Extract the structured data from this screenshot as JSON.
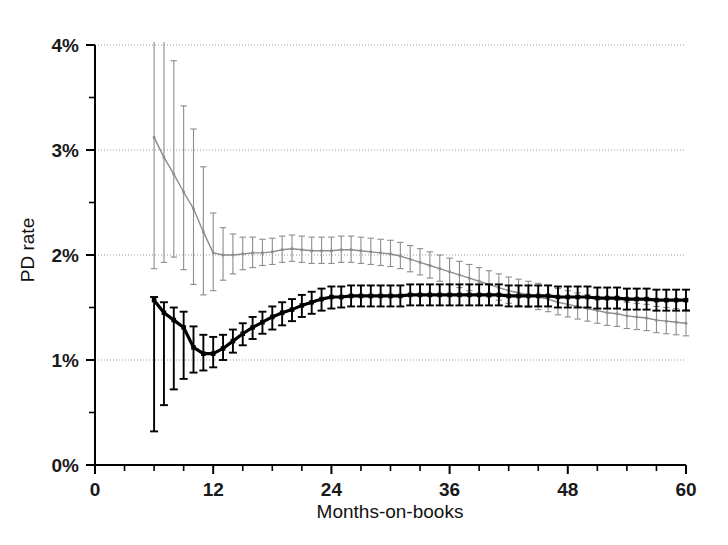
{
  "chart_data": {
    "type": "line",
    "title": "",
    "xlabel": "Months-on-books",
    "ylabel": "PD rate",
    "xlim": [
      0,
      60
    ],
    "ylim": [
      0,
      4
    ],
    "grid": "horizontal-dotted",
    "legend_position": "none",
    "x_ticks_major": [
      0,
      12,
      24,
      36,
      48,
      60
    ],
    "x_tick_labels": [
      "0",
      "12",
      "24",
      "36",
      "48",
      "60"
    ],
    "x_ticks_minor_step": 3,
    "y_ticks_major": [
      0,
      1,
      2,
      3,
      4
    ],
    "y_tick_labels": [
      "0%",
      "1%",
      "2%",
      "3%",
      "4%"
    ],
    "y_ticks_minor_step": 0.5,
    "error_bars": "vertical-whiskers-per-point",
    "series": [
      {
        "name": "series-black",
        "color": "#000000",
        "line_width": 3.2,
        "marker": "square",
        "x": [
          6,
          7,
          8,
          9,
          10,
          11,
          12,
          13,
          14,
          15,
          16,
          17,
          18,
          19,
          20,
          21,
          22,
          23,
          24,
          25,
          26,
          27,
          28,
          29,
          30,
          31,
          32,
          33,
          34,
          35,
          36,
          37,
          38,
          39,
          40,
          41,
          42,
          43,
          44,
          45,
          46,
          47,
          48,
          49,
          50,
          51,
          52,
          53,
          54,
          55,
          56,
          57,
          58,
          59,
          60
        ],
        "values": [
          1.57,
          1.45,
          1.38,
          1.31,
          1.12,
          1.06,
          1.06,
          1.11,
          1.18,
          1.25,
          1.31,
          1.36,
          1.41,
          1.45,
          1.48,
          1.52,
          1.55,
          1.58,
          1.6,
          1.6,
          1.61,
          1.61,
          1.61,
          1.61,
          1.61,
          1.61,
          1.62,
          1.62,
          1.62,
          1.62,
          1.62,
          1.62,
          1.62,
          1.62,
          1.62,
          1.62,
          1.61,
          1.61,
          1.61,
          1.61,
          1.61,
          1.6,
          1.6,
          1.6,
          1.6,
          1.59,
          1.59,
          1.59,
          1.58,
          1.58,
          1.58,
          1.57,
          1.57,
          1.57,
          1.57
        ],
        "err_low": [
          0.32,
          0.57,
          0.72,
          0.82,
          0.88,
          0.9,
          0.93,
          1.0,
          1.07,
          1.14,
          1.2,
          1.25,
          1.29,
          1.33,
          1.37,
          1.41,
          1.44,
          1.47,
          1.49,
          1.5,
          1.51,
          1.51,
          1.51,
          1.51,
          1.51,
          1.51,
          1.52,
          1.52,
          1.52,
          1.52,
          1.52,
          1.52,
          1.52,
          1.52,
          1.52,
          1.52,
          1.51,
          1.51,
          1.51,
          1.51,
          1.51,
          1.5,
          1.5,
          1.5,
          1.5,
          1.49,
          1.49,
          1.49,
          1.48,
          1.48,
          1.48,
          1.47,
          1.47,
          1.47,
          1.47
        ],
        "err_high": [
          1.6,
          1.55,
          1.5,
          1.46,
          1.32,
          1.24,
          1.22,
          1.24,
          1.29,
          1.35,
          1.41,
          1.46,
          1.51,
          1.55,
          1.58,
          1.62,
          1.65,
          1.68,
          1.7,
          1.7,
          1.71,
          1.71,
          1.71,
          1.71,
          1.71,
          1.71,
          1.72,
          1.72,
          1.72,
          1.72,
          1.72,
          1.72,
          1.72,
          1.72,
          1.72,
          1.72,
          1.71,
          1.71,
          1.71,
          1.71,
          1.71,
          1.7,
          1.7,
          1.7,
          1.7,
          1.69,
          1.69,
          1.69,
          1.68,
          1.68,
          1.68,
          1.67,
          1.67,
          1.67,
          1.67
        ]
      },
      {
        "name": "series-gray",
        "color": "#8c8c8c",
        "line_width": 1.4,
        "marker": "small-square",
        "x": [
          6,
          7,
          8,
          9,
          10,
          11,
          12,
          13,
          14,
          15,
          16,
          17,
          18,
          19,
          20,
          21,
          22,
          23,
          24,
          25,
          26,
          27,
          28,
          29,
          30,
          31,
          32,
          33,
          34,
          35,
          36,
          37,
          38,
          39,
          40,
          41,
          42,
          43,
          44,
          45,
          46,
          47,
          48,
          49,
          50,
          51,
          52,
          53,
          54,
          55,
          56,
          57,
          58,
          59,
          60
        ],
        "values": [
          3.12,
          2.93,
          2.77,
          2.6,
          2.44,
          2.22,
          2.02,
          2.0,
          2.0,
          2.01,
          2.02,
          2.02,
          2.03,
          2.05,
          2.06,
          2.05,
          2.04,
          2.04,
          2.04,
          2.05,
          2.05,
          2.04,
          2.03,
          2.02,
          2.01,
          1.99,
          1.96,
          1.93,
          1.9,
          1.87,
          1.84,
          1.81,
          1.78,
          1.75,
          1.72,
          1.69,
          1.66,
          1.64,
          1.62,
          1.6,
          1.58,
          1.55,
          1.53,
          1.51,
          1.49,
          1.47,
          1.45,
          1.44,
          1.42,
          1.41,
          1.4,
          1.38,
          1.37,
          1.36,
          1.35
        ],
        "err_low": [
          1.87,
          1.93,
          1.98,
          1.86,
          1.72,
          1.62,
          1.66,
          1.76,
          1.82,
          1.86,
          1.88,
          1.9,
          1.91,
          1.93,
          1.94,
          1.93,
          1.92,
          1.92,
          1.92,
          1.93,
          1.93,
          1.92,
          1.91,
          1.9,
          1.89,
          1.87,
          1.84,
          1.81,
          1.78,
          1.75,
          1.72,
          1.69,
          1.66,
          1.63,
          1.6,
          1.57,
          1.54,
          1.52,
          1.5,
          1.48,
          1.46,
          1.43,
          1.41,
          1.39,
          1.37,
          1.35,
          1.33,
          1.32,
          1.3,
          1.29,
          1.28,
          1.26,
          1.25,
          1.24,
          1.23
        ],
        "err_high": [
          4.4,
          4.2,
          3.85,
          3.42,
          3.2,
          2.84,
          2.4,
          2.26,
          2.2,
          2.17,
          2.17,
          2.15,
          2.16,
          2.18,
          2.19,
          2.18,
          2.17,
          2.17,
          2.17,
          2.18,
          2.18,
          2.17,
          2.16,
          2.15,
          2.14,
          2.12,
          2.09,
          2.06,
          2.03,
          2.0,
          1.97,
          1.94,
          1.91,
          1.88,
          1.85,
          1.82,
          1.79,
          1.77,
          1.75,
          1.73,
          1.71,
          1.68,
          1.66,
          1.64,
          1.62,
          1.6,
          1.58,
          1.57,
          1.55,
          1.54,
          1.53,
          1.51,
          1.5,
          1.49,
          1.48
        ]
      }
    ],
    "annotations": []
  }
}
